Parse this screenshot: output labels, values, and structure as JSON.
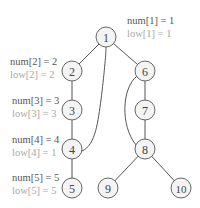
{
  "diagram": {
    "type": "dfs-tree-articulation-points",
    "colors": {
      "node_fill": "#f4f4f4",
      "node_stroke": "#666666",
      "edge": "#555555",
      "num_text": "#555555",
      "low_text": "#a8a8a8"
    },
    "nodes": [
      {
        "id": "1",
        "label": "1",
        "x": 106,
        "y": 37
      },
      {
        "id": "2",
        "label": "2",
        "x": 72,
        "y": 71
      },
      {
        "id": "3",
        "label": "3",
        "x": 72,
        "y": 110
      },
      {
        "id": "4",
        "label": "4",
        "x": 72,
        "y": 149
      },
      {
        "id": "5",
        "label": "5",
        "x": 72,
        "y": 188
      },
      {
        "id": "6",
        "label": "6",
        "x": 145,
        "y": 71
      },
      {
        "id": "7",
        "label": "7",
        "x": 145,
        "y": 110
      },
      {
        "id": "8",
        "label": "8",
        "x": 145,
        "y": 149
      },
      {
        "id": "9",
        "label": "9",
        "x": 108,
        "y": 188
      },
      {
        "id": "10",
        "label": "10",
        "x": 181,
        "y": 188
      }
    ],
    "tree_edges": [
      [
        "1",
        "2"
      ],
      [
        "2",
        "3"
      ],
      [
        "3",
        "4"
      ],
      [
        "4",
        "5"
      ],
      [
        "1",
        "6"
      ],
      [
        "6",
        "7"
      ],
      [
        "7",
        "8"
      ],
      [
        "8",
        "9"
      ],
      [
        "8",
        "10"
      ]
    ],
    "back_edges": [
      [
        "4",
        "1"
      ],
      [
        "8",
        "6"
      ]
    ],
    "annotations": [
      {
        "node": "1",
        "num": "num[1] = 1",
        "low": "low[1] = 1"
      },
      {
        "node": "2",
        "num": "num[2] = 2",
        "low": "low[2] = 2"
      },
      {
        "node": "3",
        "num": "num[3] = 3",
        "low": "low[3] = 3"
      },
      {
        "node": "4",
        "num": "num[4] = 4",
        "low": "low[4] = 1"
      },
      {
        "node": "5",
        "num": "num[5] = 5",
        "low": "low[5] = 5"
      }
    ]
  }
}
